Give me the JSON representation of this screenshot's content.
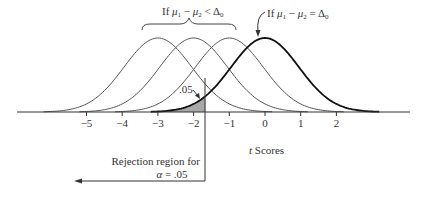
{
  "chart_data": {
    "type": "line",
    "title": "",
    "xlabel": "t Scores",
    "ylabel": "",
    "x_ticks": [
      -5,
      -4,
      -3,
      -2,
      -1,
      0,
      1,
      2
    ],
    "xlim": [
      -5.8,
      4.1
    ],
    "series": [
      {
        "name": "If μ1 − μ2 < Δ0 (shift −3)",
        "center": -3,
        "style": "thin"
      },
      {
        "name": "If μ1 − μ2 < Δ0 (shift −2)",
        "center": -2,
        "style": "thin"
      },
      {
        "name": "If μ1 − μ2 < Δ0 (shift −1)",
        "center": -1,
        "style": "thin"
      },
      {
        "name": "If μ1 − μ2 = Δ0",
        "center": 0,
        "style": "bold"
      }
    ],
    "critical_value": -1.67,
    "alpha": 0.05,
    "shaded_region": {
      "from": "-inf",
      "to": -1.67,
      "area": ".05",
      "under": "If μ1 − μ2 = Δ0"
    },
    "grid": false,
    "legend": "none"
  },
  "labels": {
    "brace_label_prefix": "If ",
    "mu1": "μ",
    "sub1": "1",
    "minus": " − ",
    "mu2": "μ",
    "sub2": "2",
    "lt": " < ",
    "eq": " = ",
    "delta": "Δ",
    "sub0": "0",
    "tail_area": ".05",
    "rejection_line1": "Rejection region for",
    "rejection_line2_alpha": "α",
    "rejection_line2_rest": " = .05",
    "xlabel_t": "t",
    "xlabel_rest": " Scores"
  },
  "ticks": [
    "−5",
    "−4",
    "−3",
    "−2",
    "−1",
    "0",
    "1",
    "2"
  ],
  "colors": {
    "curve_thin": "#555555",
    "curve_bold": "#111111",
    "axis": "#333333",
    "shade": "#a8a8a8",
    "text": "#333333"
  }
}
